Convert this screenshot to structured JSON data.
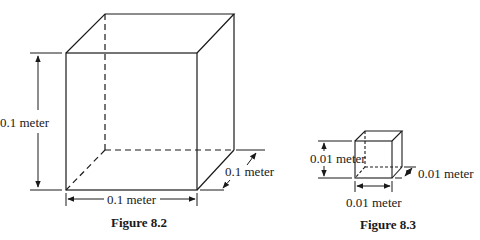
{
  "figures": [
    {
      "id": "figure-8-2",
      "caption": "Figure 8.2",
      "labels": {
        "height": "0.1 meter",
        "width": "0.1 meter",
        "depth": "0.1 meter"
      }
    },
    {
      "id": "figure-8-3",
      "caption": "Figure 8.3",
      "labels": {
        "height": "0.01 meter",
        "width": "0.01 meter",
        "depth": "0.01 meter"
      }
    }
  ],
  "colors": {
    "line": "#1a1a1a",
    "background": "#ffffff"
  }
}
